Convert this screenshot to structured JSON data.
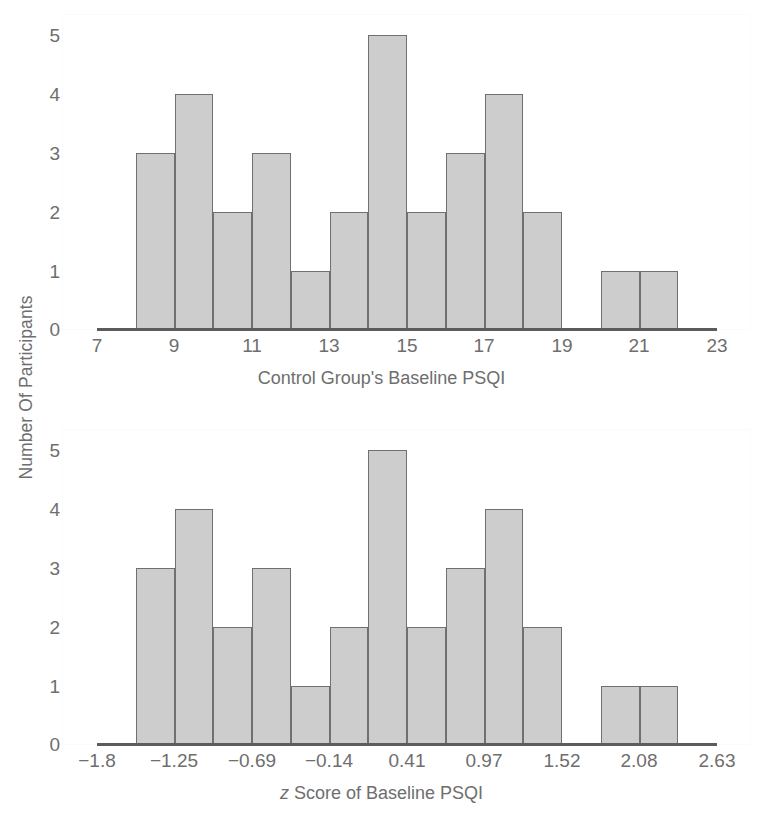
{
  "figure": {
    "shared_y_axis_label": "Number Of Participants"
  },
  "panels": [
    {
      "id": "control-group-psqi",
      "xlabel": "Control Group's Baseline PSQI",
      "xlabel_italic_prefix": "",
      "xticks": [
        "7",
        "9",
        "11",
        "13",
        "15",
        "17",
        "19",
        "21",
        "23"
      ],
      "yticks": [
        "0",
        "1",
        "2",
        "3",
        "4",
        "5"
      ]
    },
    {
      "id": "z-score-psqi",
      "xlabel": "Score of Baseline PSQI",
      "xlabel_italic_prefix": "z",
      "xticks": [
        "−1.8",
        "−1.25",
        "−0.69",
        "−0.14",
        "0.41",
        "0.97",
        "1.52",
        "2.08",
        "2.63"
      ],
      "yticks": [
        "0",
        "1",
        "2",
        "3",
        "4",
        "5"
      ]
    }
  ],
  "chart_data": [
    {
      "type": "bar",
      "title": "",
      "xlabel": "Control Group's Baseline PSQI",
      "ylabel": "Number Of Participants",
      "categories": [
        "8-9",
        "9-10",
        "10-11",
        "11-12",
        "12-13",
        "13-14",
        "14-15",
        "15-16",
        "16-17",
        "17-18",
        "18-19",
        "19-20",
        "20-21",
        "21-22"
      ],
      "bin_edges": [
        8,
        9,
        10,
        11,
        12,
        13,
        14,
        15,
        16,
        17,
        18,
        19,
        20,
        21,
        22
      ],
      "values": [
        3,
        4,
        2,
        3,
        1,
        2,
        5,
        2,
        3,
        4,
        2,
        0,
        1,
        1
      ],
      "xlim": [
        7,
        23
      ],
      "ylim": [
        0,
        5
      ],
      "xtick_values": [
        7,
        9,
        11,
        13,
        15,
        17,
        19,
        21,
        23
      ],
      "ytick_values": [
        0,
        1,
        2,
        3,
        4,
        5
      ],
      "grid": false,
      "legend": "none"
    },
    {
      "type": "bar",
      "title": "",
      "xlabel": "z Score of Baseline PSQI",
      "ylabel": "Number Of Participants",
      "categories": [
        "-1.52 to -1.25",
        "-1.25 to -0.97",
        "-0.97 to -0.69",
        "-0.69 to -0.41",
        "-0.41 to -0.14",
        "-0.14 to 0.14",
        "0.14 to 0.41",
        "0.41 to 0.69",
        "0.69 to 0.97",
        "0.97 to 1.25",
        "1.25 to 1.52",
        "1.52 to 1.80",
        "1.80 to 2.08",
        "2.08 to 2.35"
      ],
      "values": [
        3,
        4,
        2,
        3,
        1,
        2,
        5,
        2,
        3,
        4,
        2,
        0,
        1,
        1
      ],
      "xlim": [
        -1.8,
        2.63
      ],
      "ylim": [
        0,
        5
      ],
      "xtick_values": [
        -1.8,
        -1.25,
        -0.69,
        -0.14,
        0.41,
        0.97,
        1.52,
        2.08,
        2.63
      ],
      "ytick_values": [
        0,
        1,
        2,
        3,
        4,
        5
      ],
      "grid": false,
      "legend": "none"
    }
  ],
  "style": {
    "bar_fill": "#cdcdcd",
    "bar_border": "#707070",
    "axis_text": "#6e6e6e",
    "baseline": "#5c5c5c",
    "background": "#ffffff"
  }
}
